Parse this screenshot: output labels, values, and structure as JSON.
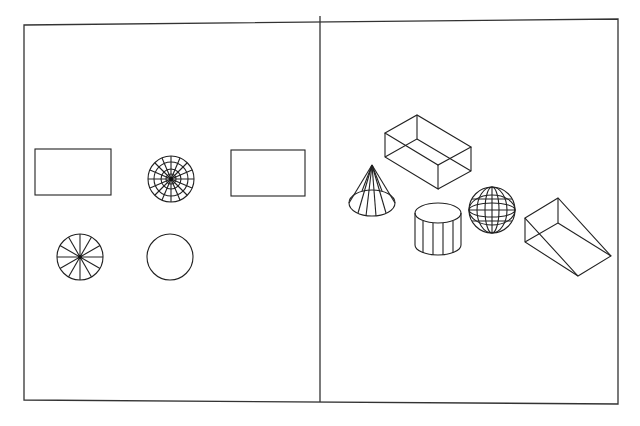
{
  "figure": {
    "panels": [
      {
        "id": "left",
        "label": "orthographic-views",
        "shapes": [
          "rectangle",
          "sphere-top-view",
          "rectangle",
          "cone-top-view",
          "circle"
        ]
      },
      {
        "id": "right",
        "label": "isometric-solids",
        "shapes": [
          "box",
          "cone",
          "cylinder",
          "sphere",
          "wedge"
        ]
      }
    ],
    "colors": {
      "line": "#222222",
      "background": "#ffffff"
    }
  }
}
